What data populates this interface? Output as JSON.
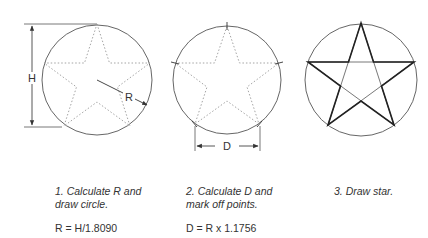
{
  "diagram": {
    "labels": {
      "height": "H",
      "radius": "R",
      "chord": "D"
    },
    "colors": {
      "line": "#444444",
      "dotted": "#9a9a9a",
      "background": "#ffffff"
    }
  },
  "steps": [
    {
      "line1": "1. Calculate R and",
      "line2": "draw circle.",
      "formula": "R = H/1.8090"
    },
    {
      "line1": "2. Calculate D and",
      "line2": "mark off points.",
      "formula": "D = R x 1.1756"
    },
    {
      "line1": "3. Draw star.",
      "line2": "",
      "formula": ""
    }
  ]
}
